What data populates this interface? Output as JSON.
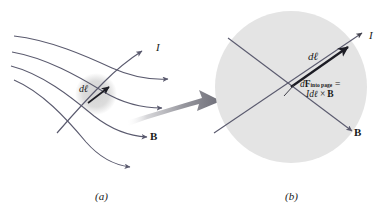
{
  "figure": {
    "background_color": "#ffffff",
    "line_color": "#5a5a6e",
    "dark_line_color": "#2a2a33",
    "shade_color": "#e2e2e2",
    "small_shade_color": "#dcdcdc",
    "big_arrow_color": "#8e8e96"
  },
  "panel_a": {
    "caption": "(a)",
    "current_label": "I",
    "element_label_d": "d",
    "element_label_l": "ℓ",
    "field_label": "B",
    "field_line_count": 4
  },
  "panel_b": {
    "caption": "(b)",
    "current_label": "I",
    "element_label_d": "d",
    "element_label_l": "ℓ",
    "field_label": "B",
    "force_label_d": "d",
    "force_label_F": "F",
    "force_subscript": "into page",
    "force_equals": "=",
    "force_expression_I": "I",
    "force_expression_d": "d",
    "force_expression_l": "ℓ",
    "force_expression_cross": "×",
    "force_expression_B": "B"
  }
}
